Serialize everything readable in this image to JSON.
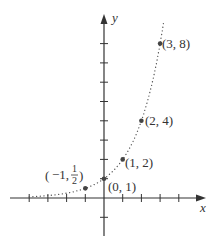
{
  "chart_data": {
    "type": "scatter",
    "title": "",
    "function": "y = 2^x",
    "xlabel": "x",
    "ylabel": "y",
    "xlim": [
      -4,
      5
    ],
    "ylim": [
      -2,
      8
    ],
    "grid": false,
    "legend": null,
    "curve_style": "dotted",
    "points": [
      {
        "x": -1,
        "y": 0.5,
        "label": "(-1, 1/2)"
      },
      {
        "x": 0,
        "y": 1,
        "label": "(0, 1)"
      },
      {
        "x": 1,
        "y": 2,
        "label": "(1, 2)"
      },
      {
        "x": 2,
        "y": 4,
        "label": "(2, 4)"
      },
      {
        "x": 3,
        "y": 8,
        "label": "(3, 8)"
      }
    ],
    "x_ticks": [
      -4,
      -3,
      -2,
      -1,
      1,
      2,
      3,
      4
    ],
    "y_ticks": [
      -1,
      1,
      2,
      3,
      4,
      5,
      6,
      7,
      8
    ]
  },
  "labels": {
    "x_axis": "x",
    "y_axis": "y",
    "p_neg1_a": "−1,",
    "p_neg1_num": "1",
    "p_neg1_den": "2",
    "p0": "(0, 1)",
    "p1": "(1, 2)",
    "p2": "(2, 4)",
    "p3": "(3, 8)"
  },
  "colors": {
    "axis": "#333333",
    "curve": "#555555",
    "point": "#444444"
  }
}
